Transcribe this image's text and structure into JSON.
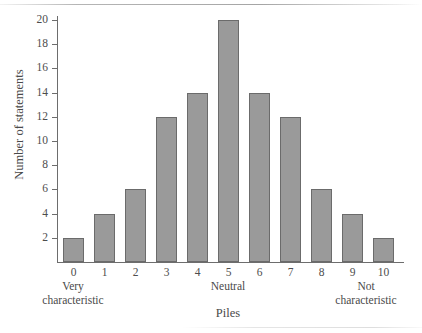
{
  "chart_data": {
    "type": "bar",
    "title": "",
    "xlabel": "Piles",
    "ylabel": "Number of statements",
    "categories": [
      "0",
      "1",
      "2",
      "3",
      "4",
      "5",
      "6",
      "7",
      "8",
      "9",
      "10"
    ],
    "values": [
      2,
      4,
      6,
      12,
      14,
      20,
      14,
      12,
      6,
      4,
      2
    ],
    "ylim": [
      0,
      20
    ],
    "yticks": [
      2,
      4,
      6,
      8,
      10,
      12,
      14,
      16,
      18,
      20
    ],
    "ytick_labels": [
      "2",
      "4",
      "6",
      "8",
      "10",
      "12",
      "14",
      "16",
      "18",
      "20"
    ],
    "xlim_categories": [
      "0",
      "10"
    ],
    "grid": false,
    "legend": null,
    "bar_color": "#9a9a9a",
    "bar_edge_color": "#6b6b6b",
    "axis_color": "#6d6d6d",
    "background_color": "#ffffff",
    "annotations": [
      {
        "name": "low-anchor",
        "at_category": "0",
        "line1": "Very",
        "line2": "characteristic"
      },
      {
        "name": "mid-anchor",
        "at_category": "5",
        "line1": "Neutral",
        "line2": ""
      },
      {
        "name": "high-anchor",
        "at_category": "10",
        "line1": "Not",
        "line2": "characteristic"
      }
    ]
  },
  "axes": {
    "y_title": "Number of statements",
    "x_title": "Piles"
  },
  "anchors": {
    "low": {
      "line1": "Very",
      "line2": "characteristic"
    },
    "mid": {
      "line1": "Neutral",
      "line2": ""
    },
    "high": {
      "line1": "Not",
      "line2": "characteristic"
    }
  }
}
